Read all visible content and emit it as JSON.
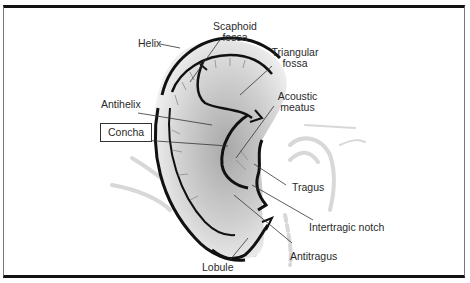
{
  "diagram": {
    "type": "anatomy-labelled-illustration",
    "highlighted_label": "Concha",
    "labels": [
      {
        "id": "helix",
        "text": "Helix"
      },
      {
        "id": "scaphoid_fossa",
        "line1": "Scaphoid",
        "line2": "fossa"
      },
      {
        "id": "triangular_fossa",
        "line1": "Triangular",
        "line2": "fossa"
      },
      {
        "id": "acoustic_meatus",
        "line1": "Acoustic",
        "line2": "meatus"
      },
      {
        "id": "antihelix",
        "text": "Antihelix"
      },
      {
        "id": "concha",
        "text": "Concha"
      },
      {
        "id": "tragus",
        "text": "Tragus"
      },
      {
        "id": "intertragic_notch",
        "text": "Intertragic notch"
      },
      {
        "id": "antitragus",
        "text": "Antitragus"
      },
      {
        "id": "lobule",
        "text": "Lobule"
      }
    ],
    "colors": {
      "outline": "#111111",
      "shading": "#c8c8c8",
      "ghost_lines": "#d9d9d9",
      "leader_lines": "#333333",
      "text": "#2a2a2a"
    }
  }
}
